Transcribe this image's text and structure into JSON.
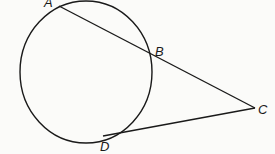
{
  "diagram": {
    "labels": {
      "A": "A",
      "B": "B",
      "C": "C",
      "D": "D"
    },
    "stroke_color": "#1a1a1a",
    "background": "#fbfbf9"
  }
}
